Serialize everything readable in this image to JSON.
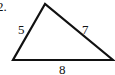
{
  "problem_number": "2.",
  "triangle": {
    "vertices": {
      "top": [
        45,
        4
      ],
      "bottom_left": [
        13,
        60
      ],
      "bottom_right": [
        113,
        60
      ]
    },
    "sides": {
      "left": "5",
      "right": "7",
      "bottom": "8"
    },
    "stroke_color": "#111111"
  }
}
